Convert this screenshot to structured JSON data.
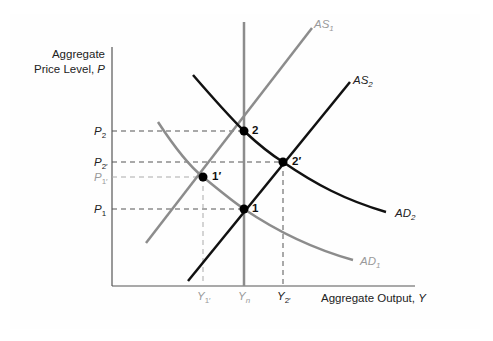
{
  "diagram": {
    "type": "AD-AS model",
    "y_axis_label_line1": "Aggregate",
    "y_axis_label_line2": "Price Level, ",
    "y_axis_var": "P",
    "x_axis_label": "Aggregate Output, ",
    "x_axis_var": "Y",
    "price_levels": [
      {
        "base": "P",
        "sub": "2",
        "color": "#222222",
        "y": 131
      },
      {
        "base": "P",
        "sub": "2′",
        "color": "#222222",
        "y": 162
      },
      {
        "base": "P",
        "sub": "1′",
        "color": "#9a9a9a",
        "y": 177
      },
      {
        "base": "P",
        "sub": "1",
        "color": "#222222",
        "y": 209
      }
    ],
    "output_levels": [
      {
        "base": "Y",
        "sub": "1′",
        "color": "#9a9a9a",
        "x": 203
      },
      {
        "base": "Y",
        "sub": "n",
        "color": "#9a9a9a",
        "x": 244
      },
      {
        "base": "Y",
        "sub": "2′",
        "color": "#222222",
        "x": 283
      }
    ],
    "curves": [
      {
        "name": "AS",
        "sub": "1",
        "color": "#8c8c8c"
      },
      {
        "name": "AS",
        "sub": "2",
        "color": "#111111"
      },
      {
        "name": "AD",
        "sub": "1",
        "color": "#8c8c8c"
      },
      {
        "name": "AD",
        "sub": "2",
        "color": "#111111"
      },
      {
        "name": "LRAS",
        "sub": "",
        "color": "#8c8c8c"
      }
    ],
    "points": [
      {
        "label": "2",
        "x": 244,
        "y": 131
      },
      {
        "label": "2′",
        "x": 283,
        "y": 162
      },
      {
        "label": "1′",
        "x": 203,
        "y": 177
      },
      {
        "label": "1",
        "x": 244,
        "y": 209
      }
    ],
    "labels": {
      "as1": "AS",
      "as1_sub": "1",
      "as2": "AS",
      "as2_sub": "2",
      "ad1": "AD",
      "ad1_sub": "1",
      "ad2": "AD",
      "ad2_sub": "2",
      "p": "P",
      "p2_sub": "2",
      "p2p_sub": "2′",
      "p1p_sub": "1′",
      "p1_sub": "1",
      "y": "Y",
      "y1p_sub": "1′",
      "yn_sub": "n",
      "y2p_sub": "2′",
      "pt2": "2",
      "pt2p": "2′",
      "pt1p": "1′",
      "pt1": "1"
    }
  }
}
